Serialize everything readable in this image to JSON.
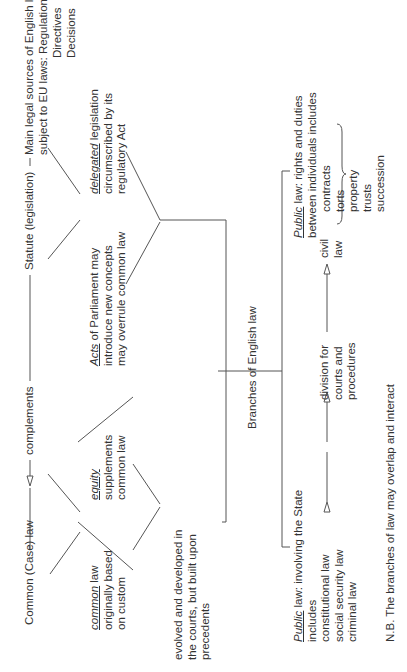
{
  "diagram": {
    "title": "Branches of English law",
    "top_row": {
      "common_case_law": "Common (Case) law",
      "complements": "complements",
      "statute": "Statute (legislation)",
      "main_sources_line1": "Main legal sources of English law",
      "main_sources_line2": "subject to EU laws: Regulations",
      "eu_directives": "Directives",
      "eu_decisions": "Decisions"
    },
    "common_law_box": {
      "term": "common",
      "line1_rest": " law",
      "line2": "originally based",
      "line3": "on custom"
    },
    "equity_box": {
      "term": "equity",
      "line2": "supplements",
      "line3": "common law"
    },
    "acts_box": {
      "term": "Acts",
      "line1_rest": " of Parliament may",
      "line2": "introduce new concepts",
      "line3": "may overrule common law"
    },
    "delegated_box": {
      "term": "delegated",
      "line1_rest": " legislation",
      "line2": "circumscribed by its",
      "line3": "regulatory Act"
    },
    "evolved_box": {
      "line1": "evolved and developed in",
      "line2": "the courts, but built upon",
      "line3": "precedents"
    },
    "branches_label": "Branches of English law",
    "public_law_box": {
      "term": "Public",
      "line1_rest": " law: involving the State",
      "line2": "includes",
      "items": [
        "constitutional law",
        "social security law",
        "criminal law"
      ]
    },
    "division": {
      "line1": "division for",
      "line2": "courts and",
      "line3": "procedures"
    },
    "civil_label": {
      "line1": "civil",
      "line2": "law"
    },
    "private_law_box": {
      "term": "Public",
      "line1_rest": " law: rights and duties",
      "line2": "between individuals includes",
      "items": [
        "contracts",
        "torts",
        "property",
        "trusts",
        "succession"
      ]
    },
    "footnote": "N.B. The branches of law may overlap and interact"
  }
}
